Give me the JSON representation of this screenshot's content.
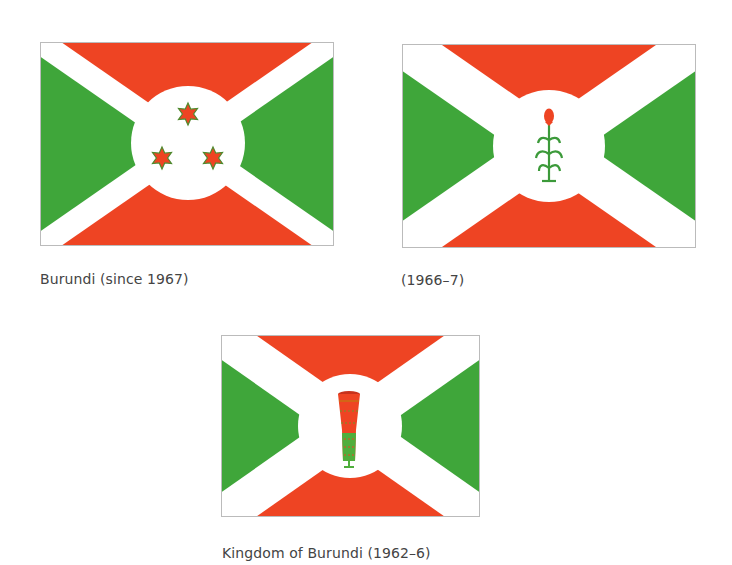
{
  "colors": {
    "green": "#3FA63A",
    "red": "#EE4423",
    "white": "#FFFFFF",
    "border": "#BBBBBB",
    "caption": "#444444"
  },
  "flags": [
    {
      "id": "burundi-current",
      "caption": "Burundi (since 1967)",
      "emblem": "three-six-pointed-stars",
      "emblem_icon": "star-of-david-icon"
    },
    {
      "id": "burundi-1966",
      "caption": "(1966–7)",
      "emblem": "sorghum-plant",
      "emblem_icon": "sorghum-icon"
    },
    {
      "id": "kingdom-of-burundi",
      "caption": "Kingdom of Burundi (1962–6)",
      "emblem": "karyenda-drum",
      "emblem_icon": "drum-icon"
    }
  ]
}
